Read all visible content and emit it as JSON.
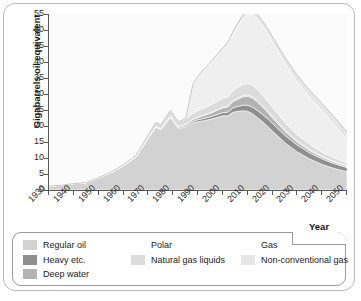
{
  "chart_data": {
    "type": "area",
    "stacked": true,
    "title": "",
    "xlabel": "Year",
    "ylabel": "Gigabarrels oil equivalent",
    "xlim": [
      1930,
      2050
    ],
    "ylim": [
      0,
      55
    ],
    "yticks": [
      0,
      5,
      10,
      15,
      20,
      25,
      30,
      35,
      40,
      45,
      50,
      55
    ],
    "xticks": [
      1930,
      1940,
      1950,
      1960,
      1970,
      1980,
      1990,
      2000,
      2010,
      2020,
      2030,
      2040,
      2050
    ],
    "grid": false,
    "legend_position": "below",
    "x": [
      1930,
      1935,
      1940,
      1945,
      1950,
      1955,
      1960,
      1965,
      1970,
      1973,
      1975,
      1979,
      1980,
      1982,
      1983,
      1985,
      1988,
      1990,
      1992,
      1995,
      2000,
      2002,
      2004,
      2006,
      2008,
      2010,
      2012,
      2014,
      2016,
      2018,
      2020,
      2025,
      2030,
      2035,
      2040,
      2045,
      2050
    ],
    "series": [
      {
        "name": "Regular oil",
        "color": "#d2d2d2",
        "values": [
          1.2,
          1.5,
          2.0,
          2.3,
          3.8,
          5.4,
          7.6,
          10.3,
          16.2,
          19.6,
          18.8,
          22.6,
          21.4,
          19.2,
          19.4,
          19.7,
          21.0,
          21.4,
          21.6,
          22.1,
          23.2,
          23.2,
          24.3,
          24.6,
          24.8,
          24.6,
          23.8,
          22.6,
          21.3,
          19.9,
          18.4,
          14.8,
          11.9,
          9.7,
          8.0,
          6.7,
          5.7
        ]
      },
      {
        "name": "Heavy etc.",
        "color": "#8f8f8f",
        "values": [
          0,
          0,
          0,
          0,
          0,
          0,
          0,
          0,
          0.1,
          0.2,
          0.2,
          0.3,
          0.3,
          0.3,
          0.3,
          0.4,
          0.5,
          0.6,
          0.7,
          0.8,
          1.0,
          1.1,
          1.3,
          1.5,
          1.7,
          1.9,
          2.1,
          2.2,
          2.3,
          2.4,
          2.4,
          2.3,
          2.1,
          1.9,
          1.7,
          1.5,
          1.3
        ]
      },
      {
        "name": "Deep water",
        "color": "#b3b3b3",
        "values": [
          0,
          0,
          0,
          0,
          0,
          0,
          0,
          0,
          0.05,
          0.1,
          0.15,
          0.3,
          0.3,
          0.3,
          0.35,
          0.4,
          0.6,
          0.7,
          0.9,
          1.1,
          1.5,
          1.7,
          2.0,
          2.3,
          2.6,
          2.8,
          2.8,
          2.6,
          2.3,
          2.0,
          1.7,
          1.2,
          0.9,
          0.7,
          0.55,
          0.45,
          0.4
        ]
      },
      {
        "name": "Polar",
        "color": "#c9c9c9",
        "values": [
          0,
          0,
          0,
          0,
          0,
          0,
          0,
          0,
          0,
          0,
          0,
          0,
          0,
          0,
          0,
          0,
          0.02,
          0.05,
          0.08,
          0.1,
          0.15,
          0.2,
          0.25,
          0.3,
          0.35,
          0.4,
          0.45,
          0.5,
          0.5,
          0.5,
          0.5,
          0.45,
          0.4,
          0.35,
          0.3,
          0.25,
          0.2
        ]
      },
      {
        "name": "Natural gas liquids",
        "color": "#dcdcdc",
        "values": [
          0,
          0,
          0,
          0,
          0.1,
          0.2,
          0.3,
          0.5,
          0.9,
          1.2,
          1.3,
          1.7,
          1.7,
          1.6,
          1.6,
          1.7,
          1.9,
          2.1,
          2.2,
          2.4,
          2.8,
          2.9,
          3.1,
          3.3,
          3.5,
          3.6,
          3.6,
          3.5,
          3.3,
          3.1,
          2.9,
          2.4,
          2.0,
          1.6,
          1.3,
          1.1,
          0.9
        ]
      },
      {
        "name": "Gas",
        "color": "#efefef",
        "values": [
          0,
          0,
          0,
          0,
          0,
          0,
          0,
          0,
          0,
          0,
          0,
          0,
          0,
          0,
          0,
          0,
          9.0,
          10.5,
          11.6,
          13.0,
          15.2,
          16.3,
          17.6,
          19.1,
          20.6,
          21.6,
          22.1,
          22.0,
          21.6,
          21.0,
          20.3,
          18.4,
          16.4,
          14.6,
          12.9,
          10.3,
          7.2
        ]
      },
      {
        "name": "Non-conventional gas",
        "color": "#e6e6e6",
        "values": [
          0,
          0,
          0,
          0,
          0,
          0,
          0,
          0,
          0,
          0,
          0,
          0,
          0,
          0,
          0,
          0,
          0.1,
          0.2,
          0.3,
          0.4,
          0.6,
          0.7,
          0.8,
          1.0,
          1.1,
          1.2,
          1.3,
          1.4,
          1.5,
          1.6,
          1.7,
          1.9,
          2.1,
          2.2,
          2.3,
          2.4,
          2.4
        ]
      }
    ],
    "total_peak": {
      "year": 2011,
      "value": 52
    }
  },
  "legend": {
    "columns": [
      {
        "items": [
          {
            "label": "Regular oil",
            "swatch": "sw-regular",
            "has_swatch": true
          },
          {
            "label": "Heavy etc.",
            "swatch": "sw-heavy",
            "has_swatch": true
          },
          {
            "label": "Deep water",
            "swatch": "sw-deep",
            "has_swatch": true
          }
        ]
      },
      {
        "items": [
          {
            "label": "Polar",
            "swatch": "",
            "has_swatch": false
          },
          {
            "label": "Natural gas liquids",
            "swatch": "sw-ngl",
            "has_swatch": true
          }
        ]
      },
      {
        "items": [
          {
            "label": "Gas",
            "swatch": "",
            "has_swatch": false
          },
          {
            "label": "Non-conventional gas",
            "swatch": "sw-nonconv",
            "has_swatch": true
          }
        ]
      }
    ]
  },
  "axis": {
    "year_label": "Year"
  }
}
